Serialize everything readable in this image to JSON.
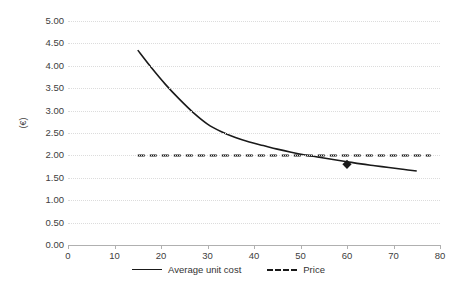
{
  "chart_data": {
    "type": "line",
    "title": "",
    "xlabel": "",
    "ylabel": "(€)",
    "xlim": [
      0,
      80
    ],
    "ylim": [
      0,
      5
    ],
    "xtick_step": 10,
    "ytick_step": 0.5,
    "grid": "horizontal-dotted",
    "legend_position": "bottom-center",
    "xticks": [
      "0",
      "10",
      "20",
      "30",
      "40",
      "50",
      "60",
      "70",
      "80"
    ],
    "yticks": [
      "0.00",
      "0.50",
      "1.00",
      "1.50",
      "2.00",
      "2.50",
      "3.00",
      "3.50",
      "4.00",
      "4.50",
      "5.00"
    ],
    "series": [
      {
        "name": "Average unit cost",
        "style": "solid",
        "color": "#1a1a1a",
        "x": [
          15,
          18,
          21,
          24,
          27,
          30,
          33,
          36,
          39,
          42,
          45,
          48,
          51,
          54,
          57,
          60,
          63,
          66,
          69,
          72,
          75
        ],
        "values": [
          4.35,
          3.95,
          3.58,
          3.25,
          2.95,
          2.7,
          2.53,
          2.4,
          2.3,
          2.22,
          2.14,
          2.07,
          2.01,
          1.96,
          1.91,
          1.86,
          1.81,
          1.77,
          1.73,
          1.69,
          1.65
        ],
        "markers": [
          {
            "x": 60,
            "y": 1.8,
            "shape": "diamond"
          }
        ]
      },
      {
        "name": "Price",
        "style": "dashed",
        "color": "#1a1a1a",
        "x": [
          15,
          78
        ],
        "values": [
          2.0,
          2.0
        ]
      }
    ],
    "annotations": [
      {
        "type": "intersection",
        "x": 50,
        "y": 2.0
      }
    ]
  },
  "legend": {
    "entries": [
      {
        "label": "Average unit cost",
        "style": "solid"
      },
      {
        "label": "Price",
        "style": "dashed"
      }
    ]
  }
}
